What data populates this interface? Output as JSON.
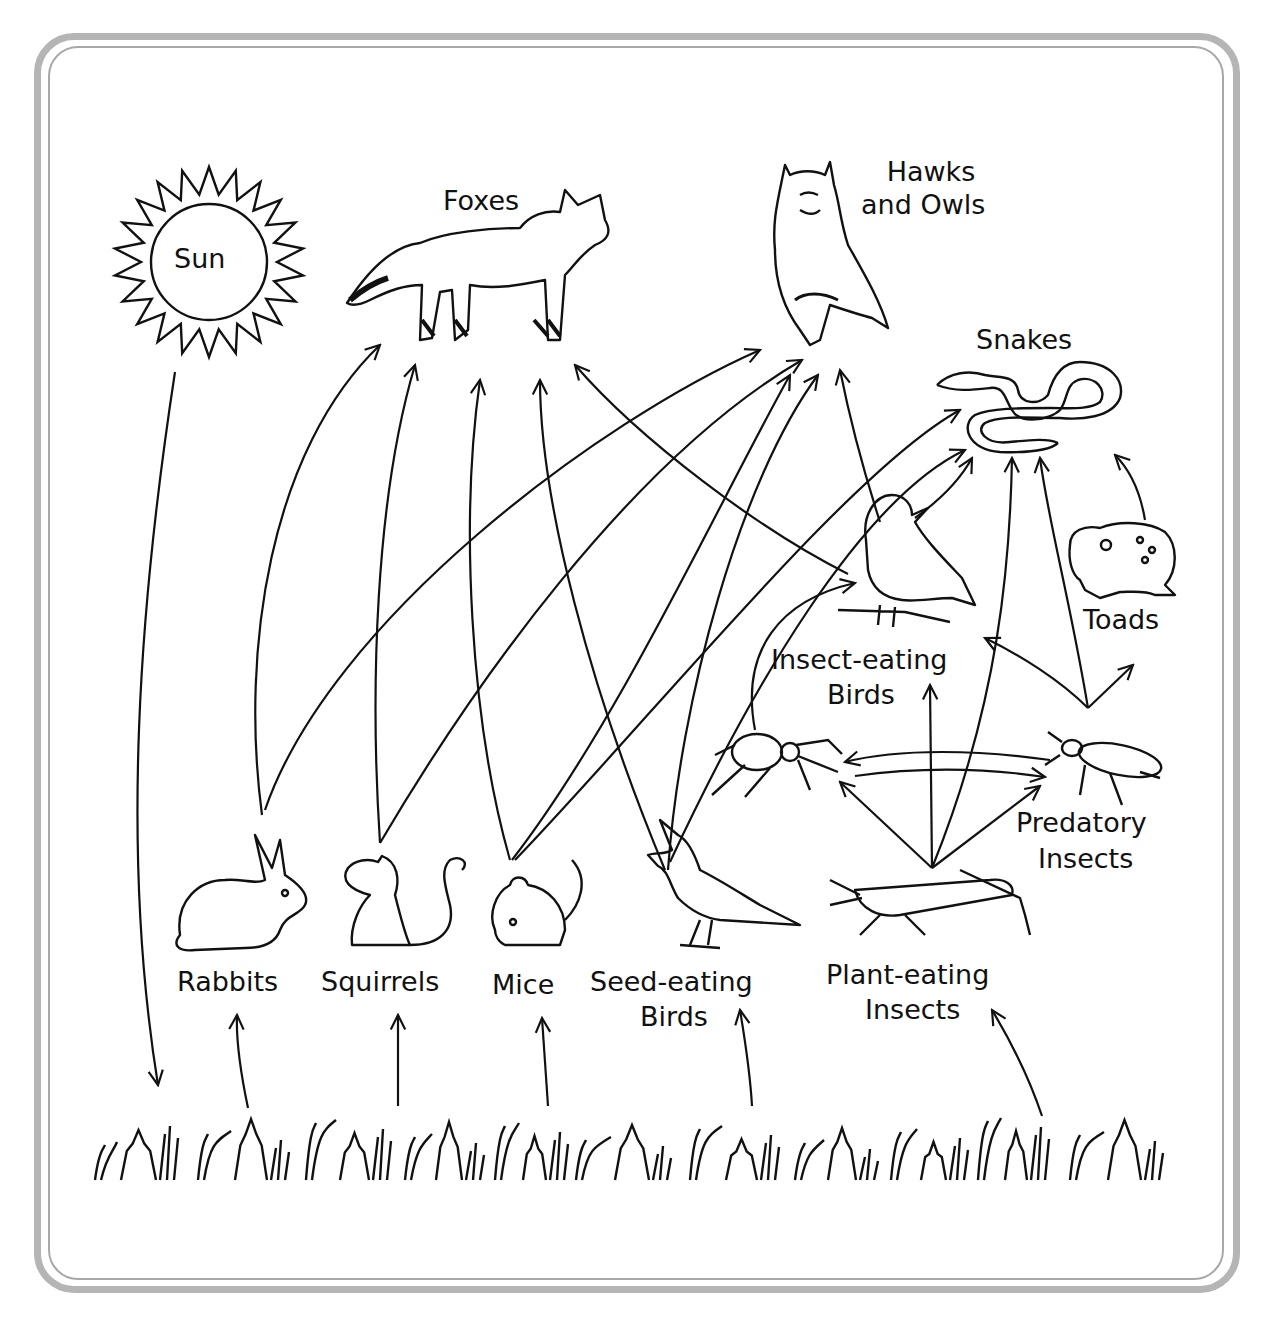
{
  "diagram": {
    "type": "food-web",
    "nodes": {
      "sun": {
        "label": "Sun"
      },
      "foxes": {
        "label": "Foxes"
      },
      "hawks_owls": {
        "line1": "Hawks",
        "line2": "and Owls"
      },
      "snakes": {
        "label": "Snakes"
      },
      "toads": {
        "label": "Toads"
      },
      "insect_birds": {
        "line1": "Insect-eating",
        "line2": "Birds"
      },
      "predatory_insects": {
        "line1": "Predatory",
        "line2": "Insects"
      },
      "spiders": {
        "label": ""
      },
      "rabbits": {
        "label": "Rabbits"
      },
      "squirrels": {
        "label": "Squirrels"
      },
      "mice": {
        "label": "Mice"
      },
      "seed_birds": {
        "line1": "Seed-eating",
        "line2": "Birds"
      },
      "plant_insects": {
        "line1": "Plant-eating",
        "line2": "Insects"
      },
      "plants": {
        "label": ""
      }
    },
    "edges": [
      [
        "Sun",
        "Plants"
      ],
      [
        "Plants",
        "Rabbits"
      ],
      [
        "Plants",
        "Squirrels"
      ],
      [
        "Plants",
        "Mice"
      ],
      [
        "Plants",
        "Seed-eating Birds"
      ],
      [
        "Plants",
        "Plant-eating Insects"
      ],
      [
        "Rabbits",
        "Foxes"
      ],
      [
        "Rabbits",
        "Hawks and Owls"
      ],
      [
        "Squirrels",
        "Foxes"
      ],
      [
        "Squirrels",
        "Hawks and Owls"
      ],
      [
        "Mice",
        "Foxes"
      ],
      [
        "Mice",
        "Hawks and Owls"
      ],
      [
        "Mice",
        "Snakes"
      ],
      [
        "Seed-eating Birds",
        "Foxes"
      ],
      [
        "Seed-eating Birds",
        "Hawks and Owls"
      ],
      [
        "Seed-eating Birds",
        "Snakes"
      ],
      [
        "Insect-eating Birds",
        "Foxes"
      ],
      [
        "Insect-eating Birds",
        "Hawks and Owls"
      ],
      [
        "Insect-eating Birds",
        "Snakes"
      ],
      [
        "Plant-eating Insects",
        "Spiders"
      ],
      [
        "Plant-eating Insects",
        "Insect-eating Birds"
      ],
      [
        "Plant-eating Insects",
        "Predatory Insects"
      ],
      [
        "Plant-eating Insects",
        "Snakes"
      ],
      [
        "Spiders",
        "Insect-eating Birds"
      ],
      [
        "Spiders",
        "Predatory Insects"
      ],
      [
        "Predatory Insects",
        "Spiders"
      ],
      [
        "Predatory Insects",
        "Insect-eating Birds"
      ],
      [
        "Predatory Insects",
        "Toads"
      ],
      [
        "Predatory Insects",
        "Snakes"
      ],
      [
        "Toads",
        "Snakes"
      ]
    ]
  }
}
